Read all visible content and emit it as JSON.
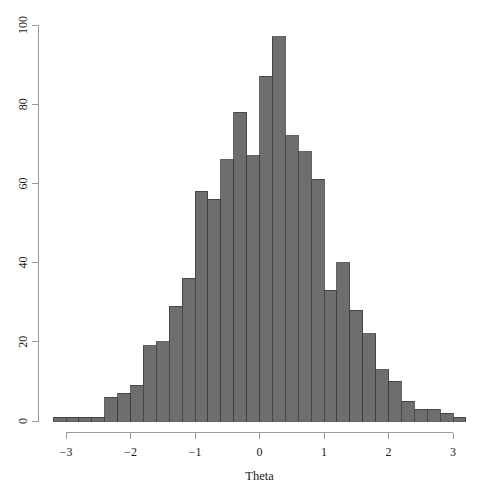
{
  "chart_data": {
    "type": "bar",
    "title": "",
    "xlabel": "Theta",
    "ylabel": "",
    "xlim": [
      -3.35,
      3.3
    ],
    "ylim": [
      0,
      100
    ],
    "grid": false,
    "legend": null,
    "bar_color": "#6e6e6e",
    "bar_border_color": "#3d3d3d",
    "axis_color": "#9a9a9a",
    "bin_width": 0.2,
    "x_ticks": [
      -3,
      -2,
      -1,
      0,
      1,
      2,
      3
    ],
    "x_tick_labels": [
      "−3",
      "−2",
      "−1",
      "0",
      "1",
      "2",
      "3"
    ],
    "y_ticks": [
      0,
      20,
      40,
      60,
      80,
      100
    ],
    "y_tick_labels": [
      "0",
      "20",
      "40",
      "60",
      "80",
      "100"
    ],
    "bin_starts": [
      -3.2,
      -3.0,
      -2.8,
      -2.6,
      -2.4,
      -2.2,
      -2.0,
      -1.8,
      -1.6,
      -1.4,
      -1.2,
      -1.0,
      -0.8,
      -0.6,
      -0.4,
      -0.2,
      0.0,
      0.2,
      0.4,
      0.6,
      0.8,
      1.0,
      1.2,
      1.4,
      1.6,
      1.8,
      2.0,
      2.2,
      2.4,
      2.6,
      2.8,
      3.0
    ],
    "bin_centers": [
      -3.1,
      -2.9,
      -2.7,
      -2.5,
      -2.3,
      -2.1,
      -1.9,
      -1.7,
      -1.5,
      -1.3,
      -1.1,
      -0.9,
      -0.7,
      -0.5,
      -0.3,
      -0.1,
      0.1,
      0.3,
      0.5,
      0.7,
      0.9,
      1.1,
      1.3,
      1.5,
      1.7,
      1.9,
      2.1,
      2.3,
      2.5,
      2.7,
      2.9,
      3.1
    ],
    "values": [
      1,
      1,
      1,
      1,
      6,
      7,
      9,
      19,
      20,
      29,
      36,
      58,
      56,
      66,
      78,
      67,
      87,
      97,
      72,
      68,
      61,
      33,
      40,
      28,
      22,
      13,
      10,
      5,
      3,
      3,
      2,
      1
    ],
    "categories": [
      "-3.2",
      "-3.0",
      "-2.8",
      "-2.6",
      "-2.4",
      "-2.2",
      "-2.0",
      "-1.8",
      "-1.6",
      "-1.4",
      "-1.2",
      "-1.0",
      "-0.8",
      "-0.6",
      "-0.4",
      "-0.2",
      "0.0",
      "0.2",
      "0.4",
      "0.6",
      "0.8",
      "1.0",
      "1.2",
      "1.4",
      "1.6",
      "1.8",
      "2.0",
      "2.2",
      "2.4",
      "2.6",
      "2.8",
      "3.0"
    ]
  }
}
